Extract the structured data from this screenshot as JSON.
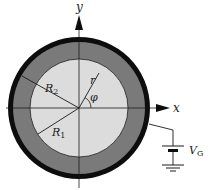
{
  "diagram": {
    "axes": {
      "x_label": "x",
      "y_label": "y"
    },
    "labels": {
      "r": "r",
      "phi": "φ",
      "R1": "R",
      "R1_sub": "1",
      "R2": "R",
      "R2_sub": "2",
      "VG": "V",
      "VG_sub": "G"
    },
    "colors": {
      "outer_ring": "#0d0d0d",
      "annulus": "#7a7a7a",
      "inner_disk": "#dcdcdc",
      "lines": "#1a1a1a",
      "background": "#ffffff"
    },
    "components": [
      "outer-conducting-shell",
      "dielectric-annulus",
      "inner-region",
      "battery",
      "ground"
    ]
  }
}
